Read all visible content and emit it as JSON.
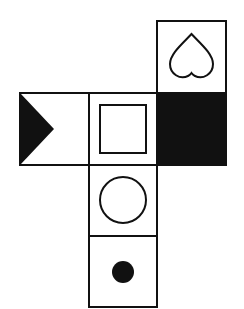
{
  "diagram": {
    "type": "cube-net",
    "faces": [
      {
        "id": "top",
        "symbol": "heart-outline"
      },
      {
        "id": "left",
        "symbol": "black-triangle"
      },
      {
        "id": "center",
        "symbol": "square-outline"
      },
      {
        "id": "right",
        "symbol": "solid-black"
      },
      {
        "id": "below-center",
        "symbol": "circle-outline"
      },
      {
        "id": "bottom",
        "symbol": "black-dot"
      }
    ],
    "colors": {
      "stroke": "#111111",
      "fill": "#111111",
      "background": "#ffffff"
    }
  }
}
